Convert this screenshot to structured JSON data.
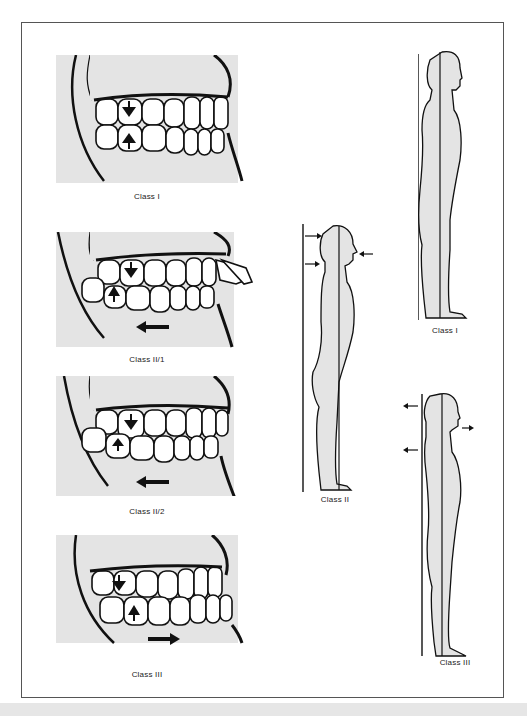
{
  "figure": {
    "colors": {
      "fill": "#e4e4e4",
      "line": "#111111",
      "frame": "#555555",
      "band": "#e6e6e6"
    },
    "dental_panels": [
      {
        "id": "class-1",
        "caption": "Class I",
        "arrow": "none"
      },
      {
        "id": "class-2-1",
        "caption": "Class II/1",
        "arrow": "left"
      },
      {
        "id": "class-2-2",
        "caption": "Class II/2",
        "arrow": "left"
      },
      {
        "id": "class-3",
        "caption": "Class III",
        "arrow": "right"
      }
    ],
    "posture_figures": [
      {
        "id": "class-1",
        "caption": "Class I"
      },
      {
        "id": "class-2",
        "caption": "Class II"
      },
      {
        "id": "class-3",
        "caption": "Class III"
      }
    ]
  }
}
